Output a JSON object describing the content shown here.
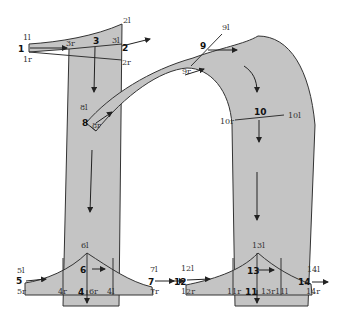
{
  "diagram": {
    "fill_color": "#c4c4c4",
    "stroke_color": "#333333",
    "segments": [
      {
        "id": "1",
        "label": "1",
        "left": "1l",
        "right": "1r"
      },
      {
        "id": "2",
        "label": "2",
        "left": "2l",
        "right": "2r"
      },
      {
        "id": "3",
        "label": "3",
        "left": "3l",
        "right": "3r"
      },
      {
        "id": "4",
        "label": "4",
        "left": "4l",
        "right": "4r"
      },
      {
        "id": "5",
        "label": "5",
        "left": "5l",
        "right": "5r"
      },
      {
        "id": "6",
        "label": "6",
        "left": "6l",
        "right": "6r"
      },
      {
        "id": "7",
        "label": "7",
        "left": "7l",
        "right": "7r"
      },
      {
        "id": "8",
        "label": "8",
        "left": "8l",
        "right": "8r"
      },
      {
        "id": "9",
        "label": "9",
        "left": "9l",
        "right": "9r"
      },
      {
        "id": "10",
        "label": "10",
        "left": "10l",
        "right": "10r"
      },
      {
        "id": "11",
        "label": "11",
        "left": "11l",
        "right": "11r"
      },
      {
        "id": "12",
        "label": "12",
        "left": "12l",
        "right": "12r"
      },
      {
        "id": "13",
        "label": "13",
        "left": "13l",
        "right": "13r"
      },
      {
        "id": "14",
        "label": "14",
        "left": "14l",
        "right": "14r"
      }
    ]
  }
}
